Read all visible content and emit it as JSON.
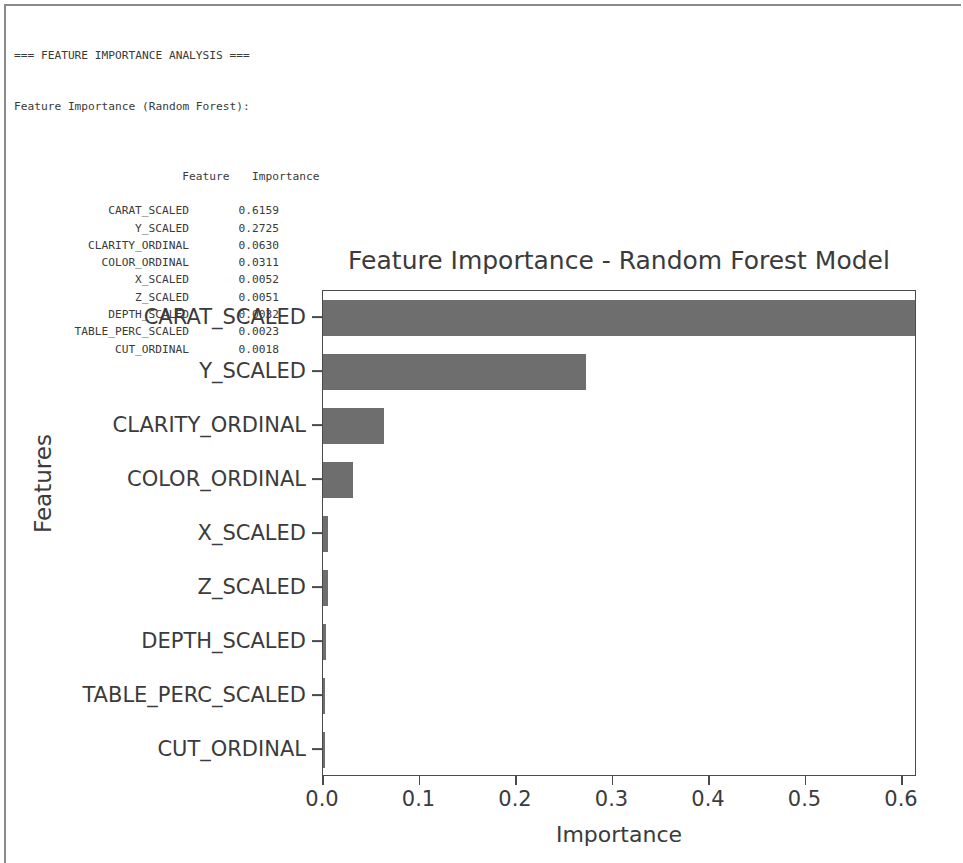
{
  "console": {
    "header": "=== FEATURE IMPORTANCE ANALYSIS ===",
    "subheader": "Feature Importance (Random Forest):",
    "col_feature": "Feature",
    "col_importance": "Importance",
    "rows": [
      {
        "feature": "CARAT_SCALED",
        "importance": "0.6159"
      },
      {
        "feature": "Y_SCALED",
        "importance": "0.2725"
      },
      {
        "feature": "CLARITY_ORDINAL",
        "importance": "0.0630"
      },
      {
        "feature": "COLOR_ORDINAL",
        "importance": "0.0311"
      },
      {
        "feature": "X_SCALED",
        "importance": "0.0052"
      },
      {
        "feature": "Z_SCALED",
        "importance": "0.0051"
      },
      {
        "feature": "DEPTH_SCALED",
        "importance": "0.0032"
      },
      {
        "feature": "TABLE_PERC_SCALED",
        "importance": "0.0023"
      },
      {
        "feature": "CUT_ORDINAL",
        "importance": "0.0018"
      }
    ]
  },
  "chart_data": {
    "type": "bar",
    "orientation": "horizontal",
    "title": "Feature Importance - Random Forest Model",
    "xlabel": "Importance",
    "ylabel": "Features",
    "categories": [
      "CARAT_SCALED",
      "Y_SCALED",
      "CLARITY_ORDINAL",
      "COLOR_ORDINAL",
      "X_SCALED",
      "Z_SCALED",
      "DEPTH_SCALED",
      "TABLE_PERC_SCALED",
      "CUT_ORDINAL"
    ],
    "values": [
      0.6159,
      0.2725,
      0.063,
      0.0311,
      0.0052,
      0.0051,
      0.0032,
      0.0023,
      0.0018
    ],
    "xticks": [
      "0.0",
      "0.1",
      "0.2",
      "0.3",
      "0.4",
      "0.5",
      "0.6"
    ],
    "xtick_values": [
      0.0,
      0.1,
      0.2,
      0.3,
      0.4,
      0.5,
      0.6
    ],
    "xlim": [
      0.0,
      0.6159
    ],
    "grid": false,
    "legend": false,
    "bar_color": "#6e6e6e",
    "axis_color": "#4a4a4a",
    "text_color": "#3b3b3b",
    "background": "#ffffff"
  }
}
